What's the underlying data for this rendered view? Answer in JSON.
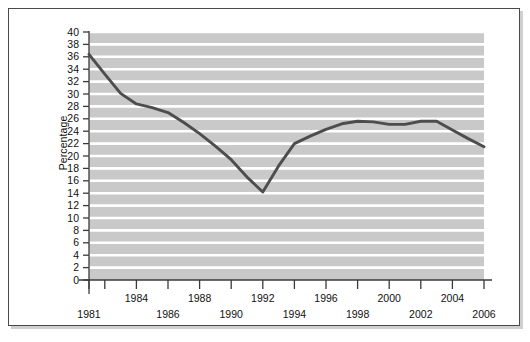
{
  "chart_data": {
    "type": "line",
    "title": "",
    "subtitle": "",
    "xlabel": "",
    "ylabel": "Percentage",
    "xlim": [
      1981,
      2006
    ],
    "ylim": [
      0,
      40
    ],
    "grid": "horizontal-white-gridlines-on-gray-background",
    "legend": "none",
    "x": [
      1981,
      1982,
      1983,
      1984,
      1985,
      1986,
      1987,
      1988,
      1989,
      1990,
      1991,
      1992,
      1993,
      1994,
      1995,
      1996,
      1997,
      1998,
      1999,
      2000,
      2001,
      2002,
      2003,
      2004,
      2005,
      2006
    ],
    "values": [
      36.4,
      33.2,
      30.1,
      28.4,
      27.8,
      27.0,
      25.4,
      23.6,
      21.6,
      19.4,
      16.6,
      14.2,
      18.4,
      22.0,
      23.2,
      24.3,
      25.2,
      25.6,
      25.5,
      25.1,
      25.1,
      25.6,
      25.6,
      24.2,
      22.8,
      21.5
    ],
    "series": [
      {
        "name": "Percentage",
        "color": "#4d4d4d",
        "values": [
          36.4,
          33.2,
          30.1,
          28.4,
          27.8,
          27.0,
          25.4,
          23.6,
          21.6,
          19.4,
          16.6,
          14.2,
          18.4,
          22.0,
          23.2,
          24.3,
          25.2,
          25.6,
          25.5,
          25.1,
          25.1,
          25.6,
          25.6,
          24.2,
          22.8,
          21.5
        ]
      }
    ],
    "y_ticks": [
      0,
      2,
      4,
      6,
      8,
      10,
      12,
      14,
      16,
      18,
      20,
      22,
      24,
      26,
      28,
      30,
      32,
      34,
      36,
      38,
      40
    ],
    "y_tick_labels": [
      "0",
      "2",
      "4",
      "6",
      "8",
      "10",
      "12",
      "14",
      "16",
      "18",
      "20",
      "22",
      "24",
      "26",
      "28",
      "30",
      "32",
      "34",
      "36",
      "38",
      "40"
    ],
    "x_ticks": [
      1981,
      1982,
      1984,
      1986,
      1988,
      1990,
      1992,
      1994,
      1996,
      1998,
      2000,
      2002,
      2004,
      2006
    ],
    "x_tick_labels_upper": [
      "1984",
      "1988",
      "1992",
      "1996",
      "2000",
      "2004"
    ],
    "x_tick_labels_upper_values": [
      1984,
      1988,
      1992,
      1996,
      2000,
      2004
    ],
    "x_tick_labels_lower": [
      "1981",
      "1986",
      "1990",
      "1994",
      "1998",
      "2002",
      "2006"
    ],
    "x_tick_labels_lower_values": [
      1981,
      1986,
      1990,
      1994,
      1998,
      2002,
      2006
    ]
  },
  "style": {
    "plot_background": "#c9c9c9",
    "gridline_color": "#ffffff",
    "line_color": "#4d4d4d",
    "axis_color": "#3a3a3a",
    "frame_border": "#4a4a4a",
    "text_color": "#111111",
    "page_background": "#ffffff"
  }
}
